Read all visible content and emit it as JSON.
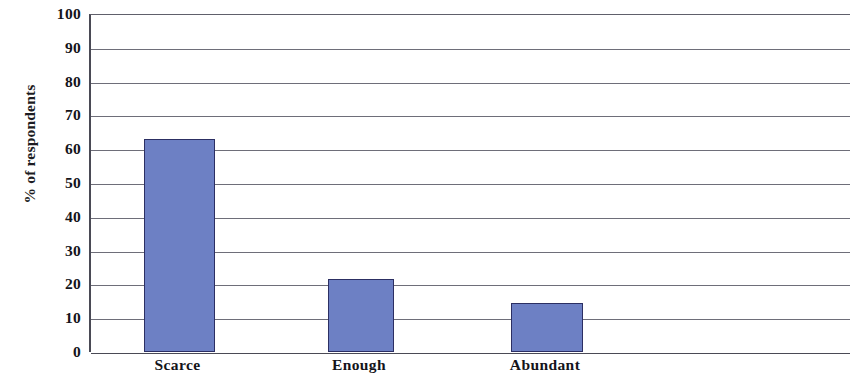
{
  "chart_data": {
    "type": "bar",
    "title": "",
    "subtitle": "",
    "xlabel": "",
    "ylabel": "% of respondents",
    "categories": [
      "Scarce",
      "Enough",
      "Abundant"
    ],
    "values": [
      63,
      21.5,
      14.5
    ],
    "series": [
      {
        "name": "% of respondents",
        "values": [
          63,
          21.5,
          14.5
        ]
      }
    ],
    "ylim": [
      0,
      100
    ],
    "y_ticks": [
      0,
      10,
      20,
      30,
      40,
      50,
      60,
      70,
      80,
      90,
      100
    ],
    "y_tick_labels": [
      "0",
      "10",
      "20",
      "30",
      "40",
      "50",
      "60",
      "70",
      "80",
      "90",
      "100"
    ],
    "grid": true,
    "grid_axis": "y",
    "legend": false,
    "legend_position": "none",
    "bar_color": "#6d80c4",
    "bar_border_color": "#2c2f63",
    "axis_color": "#4a4a55",
    "gridline_color": "#6e6e79",
    "background_color": "#ffffff",
    "annotations": []
  }
}
